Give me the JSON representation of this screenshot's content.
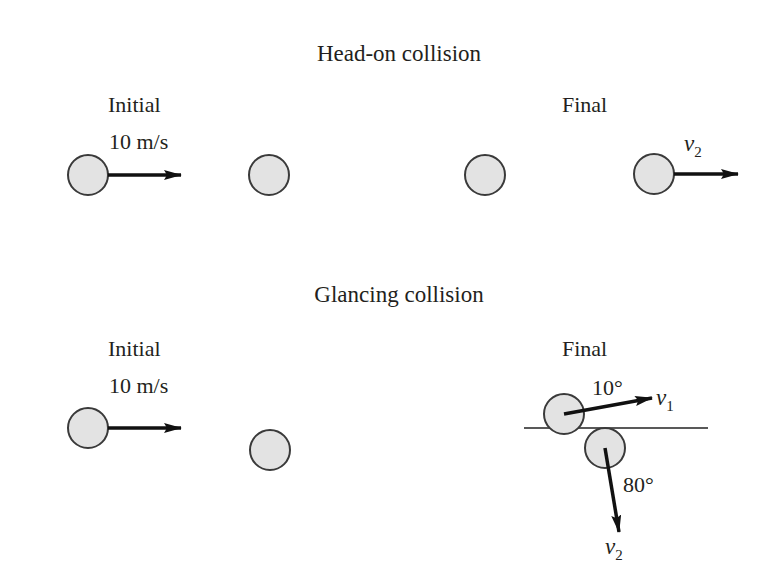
{
  "colors": {
    "ball_fill": "#e3e3e3",
    "ball_stroke": "#3a3a3a",
    "arrow": "#111111",
    "text": "#231f20",
    "background": "#ffffff"
  },
  "head_on": {
    "title": "Head-on collision",
    "initial_label": "Initial",
    "initial_speed": "10 m/s",
    "final_label": "Final",
    "final_velocity": {
      "symbol": "v",
      "subscript": "2"
    }
  },
  "glancing": {
    "title": "Glancing collision",
    "initial_label": "Initial",
    "initial_speed": "10 m/s",
    "final_label": "Final",
    "v1": {
      "symbol": "v",
      "subscript": "1",
      "angle": "10°"
    },
    "v2": {
      "symbol": "v",
      "subscript": "2",
      "angle": "80°"
    }
  }
}
